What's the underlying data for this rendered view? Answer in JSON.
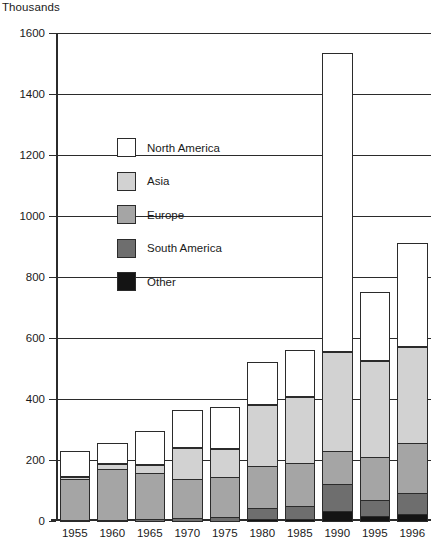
{
  "chart_data": {
    "type": "bar",
    "title": "",
    "subtitle": "",
    "unit_label": "Thousands",
    "xlabel": "",
    "ylabel": "",
    "stacked": true,
    "grid": true,
    "legend_position": "inside-upper-left",
    "ylim": [
      0,
      1600
    ],
    "ytick_step": 200,
    "ytick_labels": [
      "0",
      "200",
      "400",
      "600",
      "800",
      "1000",
      "1200",
      "1400",
      "1600"
    ],
    "ytick_values": [
      0,
      200,
      400,
      600,
      800,
      1000,
      1200,
      1400,
      1600
    ],
    "categories": [
      "1955",
      "1960",
      "1965",
      "1970",
      "1975",
      "1980",
      "1985",
      "1990",
      "1995",
      "1996"
    ],
    "series": [
      {
        "name": "Other",
        "color": "#141414",
        "values": [
          0,
          0,
          0,
          0,
          0,
          10,
          10,
          35,
          20,
          25
        ]
      },
      {
        "name": "South America",
        "color": "#6e6e6e",
        "values": [
          5,
          8,
          10,
          15,
          18,
          40,
          45,
          95,
          55,
          75
        ]
      },
      {
        "name": "Europe",
        "color": "#a5a5a5",
        "values": [
          140,
          170,
          155,
          130,
          135,
          140,
          145,
          110,
          145,
          165
        ]
      },
      {
        "name": "Asia",
        "color": "#d2d2d2",
        "values": [
          10,
          20,
          30,
          105,
          95,
          205,
          220,
          330,
          320,
          320
        ]
      },
      {
        "name": "North America",
        "color": "#ffffff",
        "values": [
          85,
          70,
          110,
          125,
          135,
          140,
          155,
          980,
          225,
          340
        ]
      }
    ],
    "totals": [
      240,
      268,
      305,
      375,
      383,
      535,
      575,
      1550,
      765,
      925
    ]
  },
  "legend": {
    "items": [
      {
        "label": "North America",
        "color": "#ffffff"
      },
      {
        "label": "Asia",
        "color": "#d2d2d2"
      },
      {
        "label": "Europe",
        "color": "#a5a5a5"
      },
      {
        "label": "South America",
        "color": "#6e6e6e"
      },
      {
        "label": "Other",
        "color": "#141414"
      }
    ]
  },
  "style": {
    "axis_color": "#2b2b2b",
    "background": "#ffffff",
    "text_color": "#1a1a1a"
  }
}
